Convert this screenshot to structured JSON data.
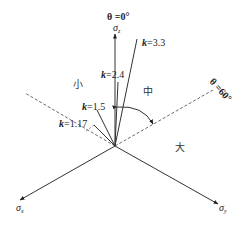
{
  "diagram": {
    "axes": {
      "sigma_z": {
        "symbol": "σ",
        "sub": "z"
      },
      "sigma_x": {
        "symbol": "σ",
        "sub": "x"
      },
      "sigma_y": {
        "symbol": "σ",
        "sub": "y"
      }
    },
    "angles": {
      "theta0": "θ =0°",
      "theta60": "θ =60°"
    },
    "k_lines": [
      {
        "k": "k",
        "value": "=3.3"
      },
      {
        "k": "k",
        "value": "=2.4"
      },
      {
        "k": "k",
        "value": "=1.5"
      },
      {
        "k": "k",
        "value": "=1.17"
      }
    ],
    "regions": {
      "small": "小",
      "medium": "中",
      "large": "大"
    }
  }
}
